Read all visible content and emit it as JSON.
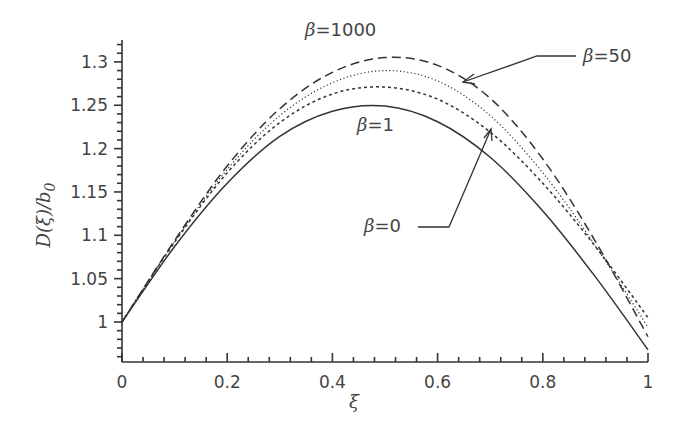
{
  "chart_data": {
    "type": "line",
    "title": "",
    "xlabel": "ξ",
    "ylabel": "D(ξ)/b0",
    "xlim": [
      0,
      1
    ],
    "ylim": [
      0.954,
      1.325
    ],
    "grid": false,
    "x_ticks": [
      "0",
      "0.2",
      "0.4",
      "0.6",
      "0.8",
      "1"
    ],
    "y_ticks": [
      "1",
      "1.05",
      "1.1",
      "1.15",
      "1.2",
      "1.25",
      "1.3"
    ],
    "x": [
      0,
      0.1,
      0.2,
      0.3,
      0.4,
      0.5,
      0.6,
      0.7,
      0.8,
      0.9,
      1.0
    ],
    "series": [
      {
        "name": "β=0",
        "style": "solid",
        "values": [
          1.0,
          1.087,
          1.16,
          1.214,
          1.243,
          1.249,
          1.231,
          1.19,
          1.128,
          1.052,
          0.968
        ]
      },
      {
        "name": "β=1",
        "style": "short-dash",
        "values": [
          1.0,
          1.092,
          1.172,
          1.23,
          1.263,
          1.271,
          1.257,
          1.219,
          1.16,
          1.087,
          1.005
        ]
      },
      {
        "name": "β=50",
        "style": "dotted",
        "values": [
          1.0,
          1.093,
          1.176,
          1.238,
          1.276,
          1.29,
          1.278,
          1.238,
          1.172,
          1.088,
          0.994
        ]
      },
      {
        "name": "β=1000",
        "style": "long-dash",
        "values": [
          1.0,
          1.094,
          1.18,
          1.246,
          1.288,
          1.305,
          1.296,
          1.258,
          1.188,
          1.093,
          0.983
        ]
      }
    ],
    "annotations": [
      {
        "text": "β=1000",
        "target": "β=1000 curve peak"
      },
      {
        "text": "β=50",
        "target": "arrow to β=50 curve near ξ≈0.63"
      },
      {
        "text": "β=1",
        "target": "below β=1 curve peak"
      },
      {
        "text": "β=0",
        "target": "arrow to curve near ξ≈0.7"
      }
    ]
  },
  "labels": {
    "beta_symbol": "β",
    "ann_1000": "=1000",
    "ann_50": "=50",
    "ann_1": "=1",
    "ann_0": "=0",
    "xlabel": "ξ",
    "ylabel_D": "D(ξ)/b",
    "ylabel_sub": "0"
  }
}
